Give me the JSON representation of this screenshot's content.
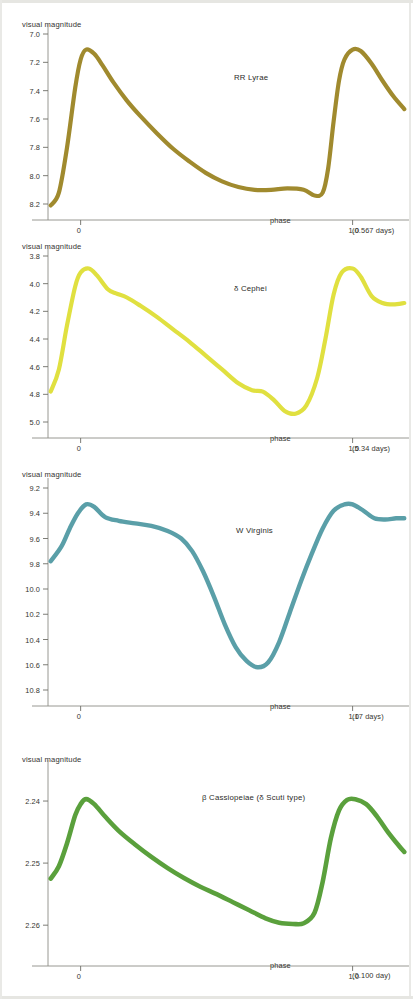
{
  "figure": {
    "kind": "variable-star-light-curves",
    "panel_count": 4,
    "shared": {
      "ylabel": "visual magnitude",
      "phase_word": "phase",
      "x_tick_zero": "0",
      "x_tick_one": "1.0"
    }
  },
  "chart_data": [
    {
      "type": "line",
      "id": "rr-lyrae",
      "title": "RR Lyrae",
      "xlabel": "phase",
      "ylabel": "visual magnitude",
      "period_caption": "(0.567 days)",
      "period_days": 0.567,
      "color": "#a08a2e",
      "y_inverted": true,
      "ylim": [
        7.0,
        8.2
      ],
      "yticks": [
        "7.0",
        "7.2",
        "7.4",
        "7.6",
        "7.8",
        "8.0",
        "8.2"
      ],
      "ytick_values": [
        7.0,
        7.2,
        7.4,
        7.6,
        7.8,
        8.0,
        8.2
      ],
      "xlim": [
        -0.12,
        1.2
      ],
      "xticks": [
        "0",
        "1.0"
      ],
      "xtick_values": [
        0,
        1.0
      ],
      "grid": false,
      "legend": "none",
      "x": [
        -0.11,
        -0.08,
        -0.05,
        -0.02,
        0.0,
        0.02,
        0.05,
        0.08,
        0.12,
        0.17,
        0.22,
        0.28,
        0.34,
        0.4,
        0.46,
        0.52,
        0.58,
        0.64,
        0.7,
        0.76,
        0.82,
        0.86,
        0.89,
        0.91,
        0.93,
        0.95,
        0.97,
        1.0,
        1.03,
        1.07,
        1.11,
        1.15,
        1.19
      ],
      "y": [
        8.21,
        8.12,
        7.8,
        7.38,
        7.18,
        7.11,
        7.14,
        7.22,
        7.34,
        7.47,
        7.58,
        7.7,
        7.81,
        7.9,
        7.98,
        8.04,
        8.08,
        8.1,
        8.1,
        8.09,
        8.1,
        8.14,
        8.12,
        7.95,
        7.62,
        7.33,
        7.18,
        7.11,
        7.12,
        7.21,
        7.33,
        7.44,
        7.53
      ]
    },
    {
      "type": "line",
      "id": "delta-cephei",
      "title": "δ Cephei",
      "xlabel": "phase",
      "ylabel": "visual magnitude",
      "period_caption": "(5.34 days)",
      "period_days": 5.34,
      "color": "#e0e040",
      "y_inverted": true,
      "ylim": [
        3.8,
        5.0
      ],
      "yticks": [
        "3.8",
        "4.0",
        "4.2",
        "4.4",
        "4.6",
        "4.8",
        "5.0"
      ],
      "ytick_values": [
        3.8,
        4.0,
        4.2,
        4.4,
        4.6,
        4.8,
        5.0
      ],
      "xlim": [
        -0.12,
        1.2
      ],
      "xticks": [
        "0",
        "1.0"
      ],
      "xtick_values": [
        0,
        1.0
      ],
      "grid": false,
      "legend": "none",
      "x": [
        -0.11,
        -0.08,
        -0.05,
        -0.02,
        0.0,
        0.03,
        0.06,
        0.1,
        0.13,
        0.17,
        0.22,
        0.28,
        0.34,
        0.4,
        0.46,
        0.52,
        0.58,
        0.63,
        0.67,
        0.71,
        0.75,
        0.79,
        0.83,
        0.87,
        0.9,
        0.93,
        0.96,
        1.0,
        1.03,
        1.07,
        1.11,
        1.15,
        1.19
      ],
      "y": [
        4.78,
        4.62,
        4.3,
        4.02,
        3.92,
        3.89,
        3.94,
        4.04,
        4.07,
        4.1,
        4.16,
        4.24,
        4.33,
        4.42,
        4.52,
        4.62,
        4.72,
        4.77,
        4.78,
        4.84,
        4.92,
        4.94,
        4.88,
        4.68,
        4.4,
        4.08,
        3.92,
        3.89,
        3.95,
        4.09,
        4.14,
        4.15,
        4.14
      ]
    },
    {
      "type": "line",
      "id": "w-virginis",
      "title": "W Virginis",
      "xlabel": "phase",
      "ylabel": "visual magnitude",
      "period_caption": "(17 days)",
      "period_days": 17,
      "color": "#5a9fa8",
      "y_inverted": true,
      "ylim": [
        9.2,
        10.8
      ],
      "yticks": [
        "9.2",
        "9.4",
        "9.6",
        "9.8",
        "10.0",
        "10.2",
        "10.4",
        "10.6",
        "10.8"
      ],
      "ytick_values": [
        9.2,
        9.4,
        9.6,
        9.8,
        10.0,
        10.2,
        10.4,
        10.6,
        10.8
      ],
      "xlim": [
        -0.12,
        1.2
      ],
      "xticks": [
        "0",
        "1.0"
      ],
      "xtick_values": [
        0,
        1.0
      ],
      "grid": false,
      "legend": "none",
      "x": [
        -0.11,
        -0.07,
        -0.04,
        -0.01,
        0.02,
        0.05,
        0.09,
        0.14,
        0.2,
        0.26,
        0.32,
        0.37,
        0.41,
        0.45,
        0.49,
        0.53,
        0.57,
        0.61,
        0.65,
        0.69,
        0.73,
        0.77,
        0.81,
        0.85,
        0.89,
        0.93,
        0.97,
        1.0,
        1.04,
        1.08,
        1.12,
        1.16,
        1.19
      ],
      "y": [
        9.78,
        9.66,
        9.52,
        9.4,
        9.33,
        9.35,
        9.43,
        9.46,
        9.48,
        9.5,
        9.54,
        9.6,
        9.7,
        9.86,
        10.06,
        10.28,
        10.46,
        10.57,
        10.62,
        10.58,
        10.42,
        10.18,
        9.94,
        9.72,
        9.52,
        9.38,
        9.33,
        9.33,
        9.38,
        9.44,
        9.45,
        9.44,
        9.44
      ]
    },
    {
      "type": "line",
      "id": "beta-cassiopeiae",
      "title": "β Cassiopeiae (δ Scuti type)",
      "xlabel": "phase",
      "ylabel": "visual magnitude",
      "period_caption": "(0.100 day)",
      "period_days": 0.1,
      "color": "#5aa03c",
      "y_inverted": true,
      "ylim": [
        2.235,
        2.264
      ],
      "yticks": [
        "2.24",
        "2.25",
        "2.26"
      ],
      "ytick_values": [
        2.24,
        2.25,
        2.26
      ],
      "xlim": [
        -0.12,
        1.2
      ],
      "xticks": [
        "0",
        "1.0"
      ],
      "xtick_values": [
        0,
        1.0
      ],
      "grid": false,
      "legend": "none",
      "x": [
        -0.11,
        -0.08,
        -0.05,
        -0.02,
        0.0,
        0.02,
        0.05,
        0.09,
        0.14,
        0.2,
        0.26,
        0.32,
        0.38,
        0.44,
        0.5,
        0.56,
        0.62,
        0.68,
        0.73,
        0.78,
        0.82,
        0.86,
        0.89,
        0.92,
        0.95,
        0.98,
        1.01,
        1.05,
        1.09,
        1.13,
        1.17,
        1.19
      ],
      "y": [
        2.2525,
        2.2505,
        2.2468,
        2.2423,
        2.2405,
        2.2397,
        2.2405,
        2.2425,
        2.2448,
        2.247,
        2.249,
        2.2508,
        2.2524,
        2.2538,
        2.255,
        2.2563,
        2.2576,
        2.2589,
        2.2596,
        2.2598,
        2.2597,
        2.258,
        2.253,
        2.246,
        2.2415,
        2.2398,
        2.2397,
        2.2405,
        2.2425,
        2.245,
        2.2472,
        2.2482
      ]
    }
  ]
}
